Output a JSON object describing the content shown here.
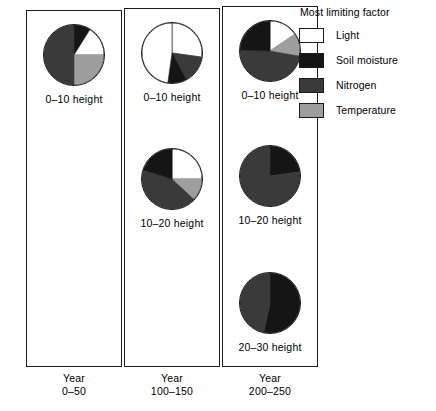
{
  "legend": {
    "title": "Most limiting factor",
    "items": [
      {
        "label": "Light",
        "key": "light",
        "color": "#ffffff"
      },
      {
        "label": "Soil moisture",
        "key": "soil_moisture",
        "color": "#151515"
      },
      {
        "label": "Nitrogen",
        "key": "nitrogen",
        "color": "#3a3a3a"
      },
      {
        "label": "Temperature",
        "key": "temperature",
        "color": "#9e9e9e"
      }
    ]
  },
  "columns": [
    {
      "year_word": "Year",
      "year_range": "0–50",
      "pies": [
        {
          "label": "0–10 height",
          "slices": [
            {
              "key": "soil_moisture",
              "start": 0,
              "end": 32
            },
            {
              "key": "light",
              "start": 32,
              "end": 90
            },
            {
              "key": "temperature",
              "start": 90,
              "end": 180
            },
            {
              "key": "nitrogen",
              "start": 180,
              "end": 360
            }
          ]
        }
      ]
    },
    {
      "year_word": "Year",
      "year_range": "100–150",
      "pies": [
        {
          "label": "0–10 height",
          "slices": [
            {
              "key": "light",
              "start": 0,
              "end": 98
            },
            {
              "key": "nitrogen",
              "start": 98,
              "end": 152
            },
            {
              "key": "soil_moisture",
              "start": 152,
              "end": 188
            },
            {
              "key": "light",
              "start": 188,
              "end": 360
            }
          ]
        },
        {
          "label": "10–20 height",
          "slices": [
            {
              "key": "light",
              "start": 0,
              "end": 90
            },
            {
              "key": "temperature",
              "start": 90,
              "end": 133
            },
            {
              "key": "nitrogen",
              "start": 133,
              "end": 288
            },
            {
              "key": "soil_moisture",
              "start": 288,
              "end": 360
            }
          ]
        }
      ]
    },
    {
      "year_word": "Year",
      "year_range": "200–250",
      "pies": [
        {
          "label": "0–10 height",
          "slices": [
            {
              "key": "light",
              "start": 0,
              "end": 56
            },
            {
              "key": "temperature",
              "start": 56,
              "end": 100
            },
            {
              "key": "nitrogen",
              "start": 100,
              "end": 272
            },
            {
              "key": "soil_moisture",
              "start": 272,
              "end": 360
            }
          ]
        },
        {
          "label": "10–20 height",
          "slices": [
            {
              "key": "soil_moisture",
              "start": 0,
              "end": 82
            },
            {
              "key": "nitrogen",
              "start": 82,
              "end": 360
            }
          ]
        },
        {
          "label": "20–30 height",
          "slices": [
            {
              "key": "soil_moisture",
              "start": 0,
              "end": 192
            },
            {
              "key": "nitrogen",
              "start": 192,
              "end": 360
            }
          ]
        }
      ]
    }
  ],
  "chart_data": {
    "type": "pie",
    "title": "Most limiting factor",
    "xlabel": "",
    "ylabel": "",
    "legend_position": "right",
    "grid": false,
    "categories": [
      "Light",
      "Soil moisture",
      "Nitrogen",
      "Temperature"
    ],
    "panels": [
      {
        "panel": "Year 0–50",
        "pies": [
          {
            "name": "0–10 height",
            "values": [
              16,
              9,
              50,
              25
            ]
          }
        ]
      },
      {
        "panel": "Year 100–150",
        "pies": [
          {
            "name": "0–10 height",
            "values": [
              75,
              10,
              15,
              0
            ]
          },
          {
            "name": "10–20 height",
            "values": [
              25,
              20,
              43,
              12
            ]
          }
        ]
      },
      {
        "panel": "Year 200–250",
        "pies": [
          {
            "name": "0–10 height",
            "values": [
              16,
              24,
              48,
              12
            ]
          },
          {
            "name": "10–20 height",
            "values": [
              0,
              23,
              77,
              0
            ]
          },
          {
            "name": "20–30 height",
            "values": [
              0,
              53,
              47,
              0
            ]
          }
        ]
      }
    ]
  }
}
